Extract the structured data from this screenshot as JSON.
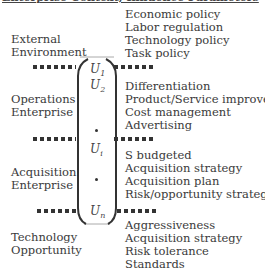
{
  "heading": "Enterprise Context, Influence Parameters",
  "categories": [
    {
      "label_line1": "External",
      "label_line2": "Environment",
      "items": [
        "Economic policy",
        "Labor regulation",
        "Technology policy",
        "Task policy"
      ]
    },
    {
      "label_line1": "Operations",
      "label_line2": "Enterprise",
      "items": [
        "Differentiation",
        "Product/Service improvement",
        "Cost management",
        "Advertising"
      ]
    },
    {
      "label_line1": "Acquisition",
      "label_line2": "Enterprise",
      "items": [
        "S budgeted",
        "Acquisition strategy",
        "Acquisition plan",
        "Risk/opportunity strategy"
      ]
    },
    {
      "label_line1": "Technology",
      "label_line2": "Opportunity",
      "items": [
        "Aggressiveness",
        "Acquisition strategy",
        "Risk tolerance",
        "Standards"
      ]
    }
  ],
  "utilities": {
    "u1": {
      "base": "U",
      "sub": "1"
    },
    "u2": {
      "base": "U",
      "sub": "2"
    },
    "ui": {
      "base": "U",
      "sub": "i"
    },
    "un": {
      "base": "U",
      "sub": "n"
    }
  }
}
